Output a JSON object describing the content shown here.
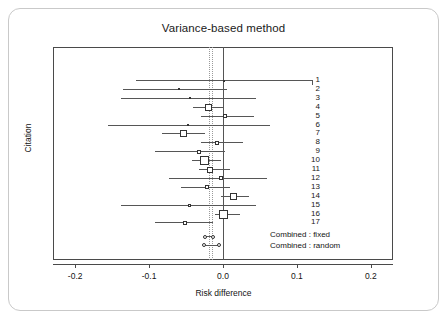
{
  "figure": {
    "title": "Variance-based method",
    "xlabel": "Risk difference",
    "ylabel": "Citation",
    "legend": {
      "fixed": "Combined : fixed",
      "random": "Combined : random"
    }
  },
  "chart_data": {
    "type": "forest",
    "title": "Variance-based method",
    "xlabel": "Risk difference",
    "ylabel": "Citation",
    "xlim": [
      -0.23,
      0.23
    ],
    "xticks": [
      -0.2,
      -0.1,
      0.0,
      0.1,
      0.2
    ],
    "xticklabels": [
      "-0.2",
      "-0.1",
      "0.0",
      "0.1",
      "0.2"
    ],
    "grid": false,
    "reference_line": 0.0,
    "pooled_reference_lines": [
      -0.0185,
      -0.0155
    ],
    "legend_position": "bottom-right",
    "categories": [
      "1",
      "2",
      "3",
      "4",
      "5",
      "6",
      "7",
      "8",
      "9",
      "10",
      "11",
      "12",
      "13",
      "14",
      "15",
      "16",
      "17"
    ],
    "studies": [
      {
        "label": "1",
        "estimate": 0.0,
        "ci_low": -0.118,
        "ci_high": 0.12,
        "weight_size": 1
      },
      {
        "label": "2",
        "estimate": -0.06,
        "ci_low": -0.135,
        "ci_high": 0.005,
        "weight_size": 2
      },
      {
        "label": "3",
        "estimate": -0.045,
        "ci_low": -0.138,
        "ci_high": 0.045,
        "weight_size": 2
      },
      {
        "label": "4",
        "estimate": -0.02,
        "ci_low": -0.041,
        "ci_high": 0.0,
        "weight_size": 7
      },
      {
        "label": "5",
        "estimate": 0.003,
        "ci_low": -0.03,
        "ci_high": 0.042,
        "weight_size": 4
      },
      {
        "label": "6",
        "estimate": -0.048,
        "ci_low": -0.155,
        "ci_high": 0.063,
        "weight_size": 2
      },
      {
        "label": "7",
        "estimate": -0.053,
        "ci_low": -0.083,
        "ci_high": -0.025,
        "weight_size": 7
      },
      {
        "label": "8",
        "estimate": -0.008,
        "ci_low": -0.03,
        "ci_high": 0.027,
        "weight_size": 4
      },
      {
        "label": "9",
        "estimate": -0.032,
        "ci_low": -0.092,
        "ci_high": 0.003,
        "weight_size": 4
      },
      {
        "label": "10",
        "estimate": -0.025,
        "ci_low": -0.042,
        "ci_high": -0.003,
        "weight_size": 9
      },
      {
        "label": "11",
        "estimate": -0.018,
        "ci_low": -0.032,
        "ci_high": 0.01,
        "weight_size": 6
      },
      {
        "label": "12",
        "estimate": -0.003,
        "ci_low": -0.073,
        "ci_high": 0.06,
        "weight_size": 4
      },
      {
        "label": "13",
        "estimate": -0.022,
        "ci_low": -0.057,
        "ci_high": 0.01,
        "weight_size": 4
      },
      {
        "label": "14",
        "estimate": 0.014,
        "ci_low": -0.003,
        "ci_high": 0.035,
        "weight_size": 7
      },
      {
        "label": "15",
        "estimate": -0.045,
        "ci_low": -0.138,
        "ci_high": 0.044,
        "weight_size": 3
      },
      {
        "label": "16",
        "estimate": 0.0,
        "ci_low": -0.011,
        "ci_high": 0.023,
        "weight_size": 9
      },
      {
        "label": "17",
        "estimate": -0.052,
        "ci_low": -0.092,
        "ci_high": -0.013,
        "weight_size": 4
      }
    ],
    "combined": [
      {
        "name": "Combined : fixed",
        "estimate": -0.0185,
        "ci_low": -0.024,
        "ci_high": -0.013
      },
      {
        "name": "Combined : random",
        "estimate": -0.0155,
        "ci_low": -0.026,
        "ci_high": -0.005
      }
    ]
  }
}
